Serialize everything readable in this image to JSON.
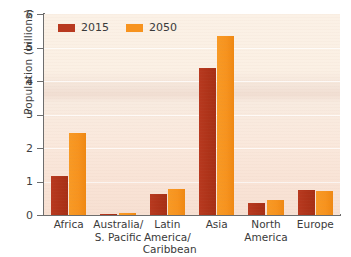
{
  "chart_data": {
    "type": "bar",
    "title": "",
    "xlabel": "",
    "ylabel": "Population (billions)",
    "ylim": [
      0,
      6
    ],
    "yticks": [
      "0",
      "1",
      "2",
      "3",
      "4",
      "5",
      "6"
    ],
    "grid": true,
    "legend_position": "top-left",
    "categories": [
      "Africa",
      "Australia/\nS. Pacific",
      "Latin America/\nCaribbean",
      "Asia",
      "North\nAmerica",
      "Europe"
    ],
    "series": [
      {
        "name": "2015",
        "color": "#b8391f",
        "values": [
          1.15,
          0.04,
          0.64,
          4.4,
          0.36,
          0.74
        ]
      },
      {
        "name": "2050",
        "color": "#f7931e",
        "values": [
          2.45,
          0.06,
          0.77,
          5.35,
          0.45,
          0.72
        ]
      }
    ]
  },
  "colors": {
    "series_2015": "#b8391f",
    "series_2050": "#f7931e",
    "plot_background": "#faeee2",
    "axis": "#6d6d6d",
    "text": "#3a3a3a",
    "page_background": "#ffffff"
  }
}
